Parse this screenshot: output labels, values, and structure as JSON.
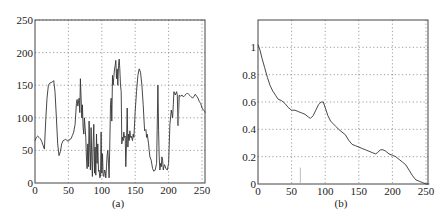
{
  "figure": {
    "panels": [
      "(a)",
      "(b)"
    ]
  },
  "chart_data": [
    {
      "type": "line",
      "panel_label": "(a)",
      "title": "",
      "xlabel": "",
      "ylabel": "",
      "xlim": [
        0,
        255
      ],
      "ylim": [
        0,
        250
      ],
      "xticks": [
        0,
        50,
        100,
        150,
        200,
        250
      ],
      "yticks": [
        0,
        50,
        100,
        150,
        200,
        250
      ],
      "grid": true,
      "legend": null,
      "line_color": "#333333",
      "x": [
        0,
        2,
        4,
        6,
        8,
        10,
        12,
        14,
        16,
        18,
        20,
        22,
        24,
        26,
        28,
        30,
        32,
        34,
        36,
        38,
        40,
        42,
        44,
        46,
        48,
        50,
        52,
        54,
        56,
        58,
        60,
        62,
        63,
        64,
        66,
        67,
        68,
        70,
        71,
        72,
        73,
        74,
        76,
        77,
        78,
        79,
        80,
        81,
        82,
        83,
        84,
        85,
        86,
        87,
        88,
        89,
        90,
        91,
        92,
        93,
        94,
        95,
        96,
        97,
        98,
        99,
        100,
        101,
        102,
        103,
        104,
        105,
        106,
        107,
        108,
        109,
        110,
        111,
        112,
        113,
        114,
        115,
        116,
        117,
        118,
        119,
        120,
        121,
        122,
        123,
        124,
        125,
        126,
        127,
        128,
        129,
        130,
        131,
        132,
        133,
        134,
        135,
        136,
        137,
        138,
        139,
        140,
        141,
        142,
        143,
        144,
        145,
        146,
        147,
        148,
        150,
        152,
        154,
        156,
        158,
        160,
        162,
        164,
        166,
        167,
        168,
        170,
        171,
        172,
        174,
        176,
        178,
        180,
        182,
        184,
        185,
        186,
        187,
        188,
        189,
        190,
        191,
        192,
        193,
        194,
        196,
        198,
        200,
        202,
        204,
        206,
        207,
        208,
        210,
        212,
        213,
        214,
        216,
        218,
        220,
        222,
        224,
        226,
        228,
        230,
        232,
        234,
        236,
        238,
        240,
        242,
        244,
        246,
        248,
        250,
        252,
        254,
        255
      ],
      "y": [
        65,
        70,
        72,
        70,
        68,
        64,
        58,
        52,
        95,
        130,
        150,
        153,
        154,
        155,
        157,
        140,
        100,
        60,
        42,
        48,
        60,
        65,
        66,
        67,
        65,
        64,
        67,
        68,
        73,
        78,
        90,
        122,
        128,
        118,
        130,
        108,
        160,
        100,
        120,
        85,
        75,
        100,
        70,
        40,
        22,
        60,
        25,
        95,
        50,
        20,
        85,
        35,
        10,
        60,
        90,
        15,
        55,
        12,
        75,
        30,
        60,
        18,
        20,
        8,
        10,
        78,
        15,
        45,
        12,
        10,
        20,
        18,
        8,
        25,
        42,
        50,
        30,
        8,
        60,
        120,
        130,
        95,
        165,
        150,
        162,
        175,
        180,
        188,
        160,
        175,
        150,
        180,
        190,
        175,
        150,
        140,
        60,
        70,
        65,
        78,
        70,
        72,
        25,
        60,
        115,
        55,
        75,
        65,
        80,
        70,
        72,
        68,
        65,
        75,
        70,
        110,
        140,
        165,
        175,
        170,
        150,
        120,
        80,
        82,
        70,
        75,
        60,
        50,
        40,
        35,
        22,
        18,
        20,
        30,
        150,
        80,
        40,
        20,
        30,
        25,
        40,
        35,
        20,
        25,
        28,
        22,
        20,
        30,
        90,
        112,
        100,
        120,
        140,
        135,
        140,
        135,
        88,
        135,
        133,
        135,
        132,
        134,
        136,
        138,
        136,
        134,
        132,
        130,
        133,
        136,
        133,
        130,
        125,
        122,
        115,
        112,
        110,
        108
      ],
      "spike": {
        "x": 215,
        "y_from": 134,
        "y_to": 88
      }
    },
    {
      "type": "line",
      "panel_label": "(b)",
      "title": "",
      "xlabel": "",
      "ylabel": "",
      "xlim": [
        0,
        255
      ],
      "ylim": [
        0,
        1.2
      ],
      "xticks": [
        0,
        50,
        100,
        150,
        200,
        250
      ],
      "yticks": [
        0,
        0.2,
        0.4,
        0.6,
        0.8,
        1
      ],
      "ytick_labels": [
        "0",
        "0.2",
        "0.4",
        "0.6",
        "0.8",
        "1"
      ],
      "grid": true,
      "legend": null,
      "line_color": "#333333",
      "x": [
        0,
        3,
        6,
        10,
        14,
        18,
        22,
        26,
        30,
        35,
        40,
        45,
        50,
        55,
        60,
        65,
        70,
        75,
        78,
        82,
        86,
        90,
        94,
        97,
        100,
        104,
        108,
        112,
        116,
        120,
        125,
        130,
        135,
        140,
        145,
        150,
        155,
        160,
        165,
        170,
        175,
        178,
        182,
        186,
        190,
        195,
        200,
        205,
        210,
        215,
        220,
        225,
        230,
        235,
        240,
        245,
        250,
        253,
        255
      ],
      "y": [
        1.02,
        0.98,
        0.92,
        0.85,
        0.78,
        0.72,
        0.68,
        0.65,
        0.62,
        0.61,
        0.59,
        0.56,
        0.54,
        0.54,
        0.53,
        0.52,
        0.51,
        0.49,
        0.48,
        0.5,
        0.54,
        0.58,
        0.6,
        0.6,
        0.56,
        0.5,
        0.46,
        0.44,
        0.42,
        0.4,
        0.38,
        0.36,
        0.32,
        0.29,
        0.28,
        0.27,
        0.26,
        0.25,
        0.24,
        0.23,
        0.22,
        0.23,
        0.25,
        0.25,
        0.24,
        0.22,
        0.21,
        0.2,
        0.18,
        0.16,
        0.14,
        0.1,
        0.06,
        0.03,
        0.02,
        0.01,
        0.0,
        0.0,
        0.0
      ],
      "marker_tick": {
        "x": 63,
        "y_from": 0,
        "y_to": 0.12
      }
    }
  ]
}
